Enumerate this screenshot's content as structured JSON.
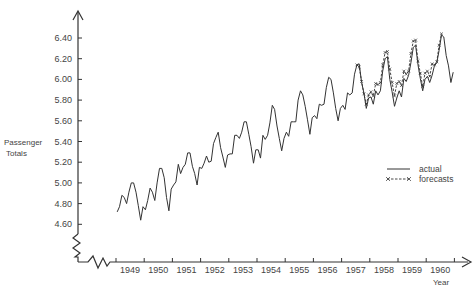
{
  "chart_data": {
    "type": "line",
    "title": "",
    "xlabel": "Year",
    "ylabel": "Passenger Totals",
    "ylabel_lines": [
      "Passenger",
      "Totals"
    ],
    "y_ticks": [
      4.6,
      4.8,
      5.0,
      5.2,
      5.4,
      5.6,
      5.8,
      6.0,
      6.2,
      6.4
    ],
    "y_tick_labels": [
      "4.60",
      "4.80",
      "5.00",
      "5.20",
      "5.40",
      "5.60",
      "5.80",
      "6.00",
      "6.20",
      "6.40"
    ],
    "x_tick_labels": [
      "1949",
      "1950",
      "1951",
      "1952",
      "1953",
      "1954",
      "1955",
      "1956",
      "1957",
      "1958",
      "1959",
      "1960"
    ],
    "ylim": [
      4.45,
      6.5
    ],
    "xlim": [
      1949,
      1961
    ],
    "grid": false,
    "legend_position": "right-middle",
    "legend": [
      "actual",
      "forecasts"
    ],
    "series": [
      {
        "name": "actual",
        "style": "solid",
        "start": "1949-01",
        "frequency": "monthly",
        "values": [
          4.72,
          4.77,
          4.88,
          4.86,
          4.8,
          4.91,
          5.0,
          5.0,
          4.91,
          4.78,
          4.64,
          4.77,
          4.74,
          4.83,
          4.95,
          4.91,
          4.83,
          5.0,
          5.14,
          5.14,
          5.05,
          4.86,
          4.73,
          4.94,
          4.98,
          5.01,
          5.18,
          5.09,
          5.15,
          5.18,
          5.29,
          5.29,
          5.16,
          5.09,
          4.98,
          5.15,
          5.14,
          5.19,
          5.26,
          5.2,
          5.21,
          5.38,
          5.44,
          5.49,
          5.34,
          5.25,
          5.15,
          5.27,
          5.28,
          5.28,
          5.46,
          5.46,
          5.43,
          5.49,
          5.59,
          5.59,
          5.47,
          5.35,
          5.19,
          5.32,
          5.32,
          5.24,
          5.46,
          5.42,
          5.46,
          5.58,
          5.75,
          5.71,
          5.55,
          5.43,
          5.31,
          5.43,
          5.49,
          5.45,
          5.59,
          5.59,
          5.59,
          5.8,
          5.89,
          5.85,
          5.74,
          5.61,
          5.47,
          5.63,
          5.65,
          5.62,
          5.76,
          5.75,
          5.76,
          5.92,
          6.02,
          6.0,
          5.87,
          5.72,
          5.6,
          5.72,
          5.75,
          5.71,
          5.87,
          5.85,
          5.87,
          6.05,
          6.14,
          6.15,
          5.97,
          5.87,
          5.72,
          5.82,
          5.83,
          5.76,
          5.89,
          5.85,
          5.89,
          6.08,
          6.2,
          6.22,
          6.0,
          5.88,
          5.74,
          5.82,
          5.89,
          5.83,
          6.01,
          5.98,
          6.04,
          6.16,
          6.31,
          6.33,
          6.14,
          6.01,
          5.89,
          6.0,
          6.03,
          5.97,
          6.04,
          6.13,
          6.16,
          6.28,
          6.43,
          6.41,
          6.23,
          6.13,
          5.97,
          6.07
        ]
      },
      {
        "name": "forecasts",
        "style": "dashed-with-x-markers",
        "start": "1957-07",
        "frequency": "monthly",
        "values": [
          6.14,
          6.12,
          5.98,
          5.86,
          5.76,
          5.85,
          5.88,
          5.84,
          5.96,
          5.95,
          5.97,
          6.14,
          6.26,
          6.27,
          6.1,
          5.97,
          5.84,
          5.96,
          5.98,
          5.94,
          6.08,
          6.05,
          6.08,
          6.25,
          6.37,
          6.38,
          6.18,
          6.06,
          5.93,
          6.06,
          6.08,
          6.03,
          6.15,
          6.14,
          6.17,
          6.33,
          6.44
        ]
      }
    ]
  },
  "axes": {
    "y_title_line1": "Passenger",
    "y_title_line2": "Totals",
    "x_title": "Year"
  },
  "legend": {
    "actual_label": "actual",
    "forecasts_label": "forecasts"
  }
}
